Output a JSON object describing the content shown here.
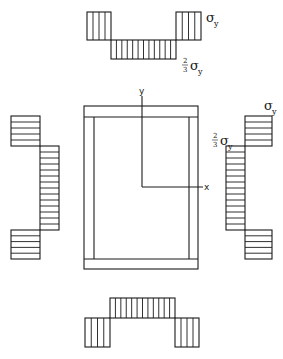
{
  "diagram": {
    "section": {
      "outer": {
        "x": 84,
        "y": 106,
        "w": 114,
        "h": 163
      },
      "top_flange_bottom": 117,
      "bottom_flange_top": 259,
      "left_web_inner": 94,
      "right_web_inner": 189
    },
    "axes": {
      "origin": {
        "x": 142,
        "y": 187
      },
      "y_top": 96,
      "x_right": 203,
      "x_label": "x",
      "y_label": "y"
    },
    "labels": {
      "sigma_y": "σ",
      "sigma_sub": "y",
      "frac_num": "2",
      "frac_den": "3"
    },
    "stress_blocks": {
      "top": [
        {
          "name": "top-left-tension",
          "x": 87,
          "y": 12,
          "w": 24,
          "h": 28,
          "hatch": "vertical",
          "lines": 3
        },
        {
          "name": "top-middle-compression",
          "x": 111,
          "y": 40,
          "w": 65,
          "h": 19,
          "hatch": "vertical",
          "lines": 11
        },
        {
          "name": "top-right-tension",
          "x": 176,
          "y": 12,
          "w": 25,
          "h": 28,
          "hatch": "vertical",
          "lines": 3
        }
      ],
      "bottom": [
        {
          "name": "bottom-left-tension",
          "x": 85,
          "y": 318,
          "w": 25,
          "h": 29,
          "hatch": "vertical",
          "lines": 3
        },
        {
          "name": "bottom-middle-compression",
          "x": 110,
          "y": 298,
          "w": 65,
          "h": 20,
          "hatch": "vertical",
          "lines": 11
        },
        {
          "name": "bottom-right-tension",
          "x": 175,
          "y": 318,
          "w": 24,
          "h": 29,
          "hatch": "vertical",
          "lines": 3
        }
      ],
      "left": [
        {
          "name": "left-top-tension",
          "x": 11,
          "y": 116,
          "w": 29,
          "h": 30,
          "hatch": "horizontal",
          "lines": 4
        },
        {
          "name": "left-middle-compression",
          "x": 40,
          "y": 146,
          "w": 19,
          "h": 84,
          "hatch": "horizontal",
          "lines": 13
        },
        {
          "name": "left-bottom-tension",
          "x": 11,
          "y": 230,
          "w": 29,
          "h": 29,
          "hatch": "horizontal",
          "lines": 4
        }
      ],
      "right": [
        {
          "name": "right-top-tension",
          "x": 245,
          "y": 116,
          "w": 27,
          "h": 30,
          "hatch": "horizontal",
          "lines": 4
        },
        {
          "name": "right-middle-compression",
          "x": 226,
          "y": 146,
          "w": 19,
          "h": 84,
          "hatch": "horizontal",
          "lines": 13
        },
        {
          "name": "right-bottom-tension",
          "x": 245,
          "y": 230,
          "w": 27,
          "h": 29,
          "hatch": "horizontal",
          "lines": 4
        }
      ]
    },
    "annotations": [
      {
        "name": "top-sigma-y-label",
        "type": "sigma",
        "x": 206,
        "y": 22
      },
      {
        "name": "top-two-thirds-sigma-y-label",
        "type": "frac-sigma",
        "x": 182,
        "y": 70
      },
      {
        "name": "right-sigma-y-label",
        "type": "sigma",
        "x": 264,
        "y": 110
      },
      {
        "name": "right-two-thirds-sigma-y-label",
        "type": "frac-sigma",
        "x": 212,
        "y": 145
      }
    ]
  }
}
